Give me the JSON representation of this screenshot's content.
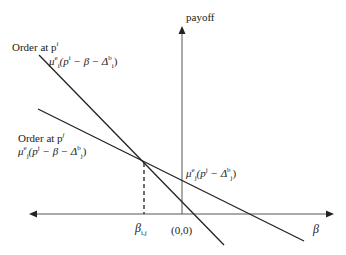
{
  "diagram": {
    "y_axis_label": "payoff",
    "x_axis_label": "β",
    "origin_label": "(0,0)",
    "intersection_label": "β",
    "intersection_sub": "i,j",
    "order_i_label": "Order at p",
    "order_i_sup": "i",
    "order_i_expr": "μ",
    "order_i_expr_sup": "e",
    "order_i_expr_sub": "i",
    "order_i_expr_body": "(p",
    "order_i_expr_body_sup": "i",
    "order_i_expr_tail": " − β − Δ",
    "order_i_expr_tail_sup": "b",
    "order_i_expr_tail_sub": "i",
    "order_j_label": "Order at p",
    "order_j_sup": "j",
    "order_j_expr": "μ",
    "order_j_expr_sup": "e",
    "order_j_expr_sub": "j",
    "order_j_expr_body": "(p",
    "order_j_expr_body_sup": "j",
    "order_j_expr_tail": " − β − Δ",
    "order_j_expr_tail_sup": "b",
    "order_j_expr_tail_sub": "j",
    "intercept_j_expr": "μ",
    "intercept_j_expr_sup": "e",
    "intercept_j_expr_sub": "j",
    "intercept_j_body": "(p",
    "intercept_j_body_sup": "j",
    "intercept_j_tail": " − Δ",
    "intercept_j_tail_sup": "b",
    "intercept_j_tail_sub": "j",
    "close_paren": ")"
  }
}
